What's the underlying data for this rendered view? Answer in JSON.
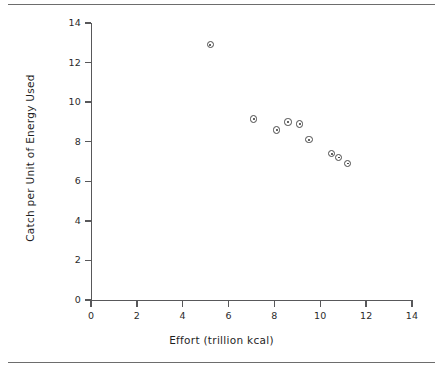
{
  "chart_data": {
    "type": "scatter",
    "title": "",
    "xlabel": "Effort (trillion kcal)",
    "ylabel": "Catch per Unit of Energy Used",
    "xlim": [
      0,
      14
    ],
    "ylim": [
      0,
      14
    ],
    "xticks": [
      0,
      2,
      4,
      6,
      8,
      10,
      12,
      14
    ],
    "yticks": [
      0,
      2,
      4,
      6,
      8,
      10,
      12,
      14
    ],
    "xtick_labels": [
      "0",
      "2",
      "4",
      "6",
      "8",
      "10",
      "12",
      "14"
    ],
    "ytick_labels": [
      "0",
      "2",
      "4",
      "6",
      "8",
      "10",
      "12",
      "14"
    ],
    "grid": false,
    "legend": false,
    "marker": "circle-with-dot",
    "marker_color": "#4a4a4a",
    "series": [
      {
        "name": "catch-per-effort",
        "points": [
          {
            "x": 5.2,
            "y": 12.9
          },
          {
            "x": 7.1,
            "y": 9.15
          },
          {
            "x": 8.1,
            "y": 8.6
          },
          {
            "x": 8.6,
            "y": 9.0
          },
          {
            "x": 9.1,
            "y": 8.9
          },
          {
            "x": 9.5,
            "y": 8.1
          },
          {
            "x": 10.5,
            "y": 7.4
          },
          {
            "x": 10.8,
            "y": 7.2
          },
          {
            "x": 11.2,
            "y": 6.9
          }
        ]
      }
    ]
  },
  "figure": {
    "background_color": "#ffffff",
    "axis_color": "#58585a",
    "rule_color": "#6d6d6d"
  }
}
